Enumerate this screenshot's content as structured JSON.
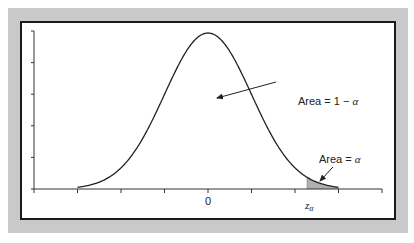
{
  "chart_data": {
    "type": "area",
    "title": "",
    "xlabel": "",
    "ylabel": "",
    "distribution": "normal",
    "mean": 0,
    "sd": 1,
    "xlim": [
      -4,
      4
    ],
    "x_ticks": [
      -4,
      -3,
      -2,
      -1,
      0,
      1,
      2,
      3,
      4
    ],
    "y_tick_count": 6,
    "tick_labels": [
      {
        "x": 0,
        "text": "0"
      },
      {
        "x": 2.28,
        "text": "z",
        "subscript": "α"
      }
    ],
    "critical_value": {
      "name": "z_α",
      "x": 2.28
    },
    "shaded_region": {
      "from": 2.28,
      "to": 3.0,
      "color": "#b0b0b0",
      "label": "Area = α"
    },
    "annotations": [
      {
        "text_prefix": "Area = 1 − ",
        "symbol": "α",
        "points_to": "center of curve"
      },
      {
        "text_prefix": "Area = ",
        "symbol": "α",
        "points_to": "right tail"
      }
    ],
    "grid": false,
    "legend": "none"
  },
  "colors": {
    "frame": "#c9c9c9",
    "border": "#1a1a1a",
    "curve": "#222222",
    "shade": "#b0b0b0"
  }
}
